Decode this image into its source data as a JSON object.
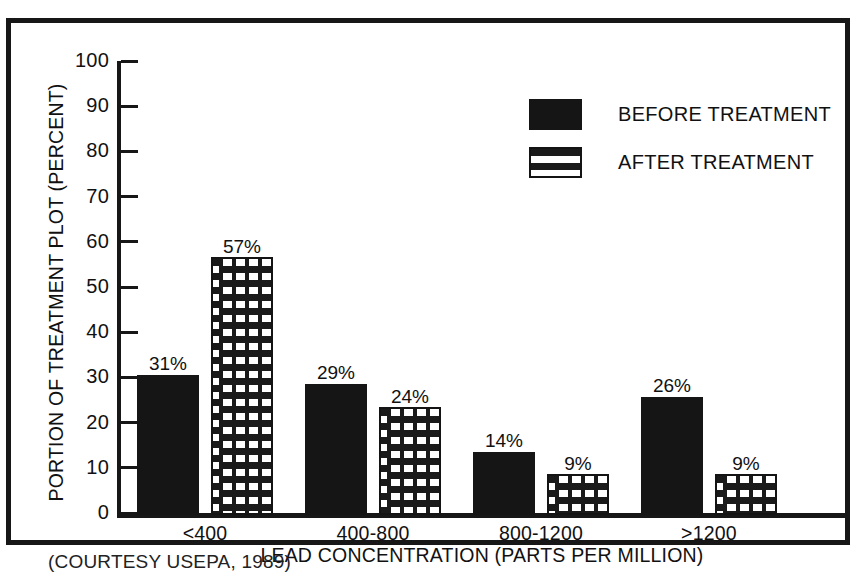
{
  "caption": "(COURTESY USEPA, 1989)",
  "colors": {
    "before_fill": "#151515",
    "after_fill": "#ffffff",
    "after_pattern": "#1a1a1a",
    "axis": "#171717",
    "frame": "#171717",
    "background": "#ffffff"
  },
  "legend": {
    "position": "top-right",
    "entries": [
      {
        "label": "BEFORE TREATMENT",
        "swatch": "solid-black-swatch"
      },
      {
        "label": "AFTER TREATMENT",
        "swatch": "stippled-swatch"
      }
    ]
  },
  "chart_data": {
    "type": "bar",
    "title": "",
    "xlabel": "LEAD CONCENTRATION (PARTS PER MILLION)",
    "ylabel": "PORTION OF TREATMENT PLOT (PERCENT)",
    "categories": [
      "<400",
      "400-800",
      "800-1200",
      ">1200"
    ],
    "series": [
      {
        "name": "BEFORE TREATMENT",
        "values": [
          31,
          29,
          14,
          26
        ],
        "labels": [
          "31%",
          "29%",
          "14%",
          "26%"
        ]
      },
      {
        "name": "AFTER TREATMENT",
        "values": [
          57,
          24,
          9,
          9
        ],
        "labels": [
          "57%",
          "24%",
          "9%",
          "9%"
        ]
      }
    ],
    "ylim": [
      0,
      100
    ],
    "yticks": [
      0,
      10,
      20,
      30,
      40,
      50,
      60,
      70,
      80,
      90,
      100
    ],
    "ytick_labels": [
      "0",
      "10",
      "20",
      "30",
      "40",
      "50",
      "60",
      "70",
      "80",
      "90",
      "100"
    ],
    "grid": false,
    "legend_position": "top-right"
  }
}
